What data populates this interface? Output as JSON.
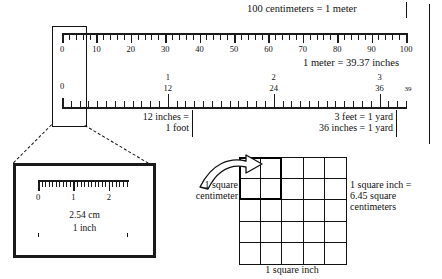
{
  "cm_ruler": {
    "name": "centimeter-ruler",
    "min": 0,
    "max": 100,
    "minor_step": 2,
    "major_step": 10,
    "labels": [
      "0",
      "10",
      "20",
      "30",
      "40",
      "50",
      "60",
      "70",
      "80",
      "90",
      "100"
    ],
    "label_values": [
      0,
      10,
      20,
      30,
      40,
      50,
      60,
      70,
      80,
      90,
      100
    ],
    "note": "100 centimeters = 1 meter"
  },
  "inch_ruler": {
    "name": "inch-ruler",
    "min": 0,
    "max": 39,
    "minor_step": 1,
    "labels_primary": [
      "0",
      "12",
      "24",
      "36"
    ],
    "labels_primary_values": [
      0,
      12,
      24,
      36
    ],
    "labels_secondary": [
      "1",
      "2",
      "3"
    ],
    "labels_secondary_values": [
      12,
      24,
      36
    ],
    "end_label": "39",
    "end_label_value": 39,
    "note": "1 meter = 39.37 inches"
  },
  "callouts": {
    "foot_line1": "12 inches =",
    "foot_line2": "1 foot",
    "yard_line1": "3 feet = 1 yard",
    "yard_line2": "36 inches = 1 yard"
  },
  "inset": {
    "name": "one-inch-magnifier",
    "ruler_labels": [
      "0",
      "1",
      "2"
    ],
    "ruler_label_values": [
      0,
      1,
      2
    ],
    "cm_text": "2.54 cm",
    "inch_text": "1 inch",
    "minor_ticks_per_cm": 10,
    "span_cm": 2.54
  },
  "area_figure": {
    "name": "square-inch-grid",
    "rows": 5,
    "cols": 5,
    "highlight_rows": 2,
    "highlight_cols": 2,
    "arrow_label_line1": "1 square",
    "arrow_label_line2": "centimeter",
    "right_text_line1": "1 square inch =",
    "right_text_line2": "6.45 square",
    "right_text_line3": "centimeters",
    "bottom_text": "1 square inch"
  },
  "colors": {
    "ink": "#111111",
    "rule": "#1a1a1a",
    "background": "#ffffff"
  }
}
